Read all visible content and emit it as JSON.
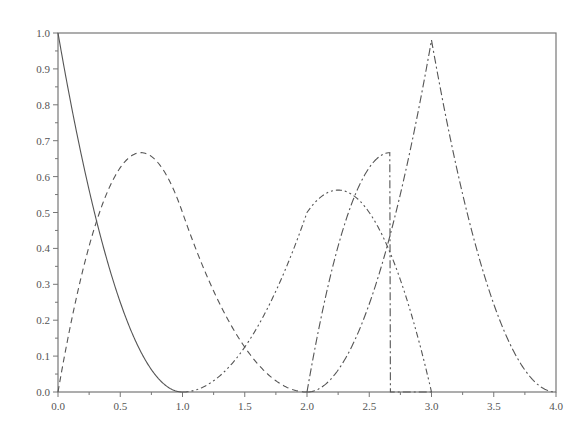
{
  "chart_data": {
    "type": "line",
    "title": "",
    "xlabel": "",
    "ylabel": "",
    "xlim": [
      0.0,
      4.0
    ],
    "ylim": [
      0.0,
      1.0
    ],
    "grid": false,
    "legend": null,
    "x_ticks": [
      "0.0",
      "0.5",
      "1.0",
      "1.5",
      "2.0",
      "2.5",
      "3.0",
      "3.5",
      "4.0"
    ],
    "y_ticks": [
      "0.0",
      "0.1",
      "0.2",
      "0.3",
      "0.4",
      "0.5",
      "0.6",
      "0.7",
      "0.8",
      "0.9",
      "1.0"
    ],
    "series": [
      {
        "name": "N0",
        "style": "solid",
        "support": [
          0,
          1
        ],
        "peak_x": 0.0,
        "peak_y": 1.0
      },
      {
        "name": "N1",
        "style": "dashed",
        "support": [
          0,
          2
        ],
        "peak_x": 0.67,
        "peak_y": 0.667
      },
      {
        "name": "N2",
        "style": "dash-dot-dot",
        "support": [
          1,
          3
        ],
        "peak_x": 1.5,
        "peak_y": 0.75
      },
      {
        "name": "N3",
        "style": "dash-dot",
        "support": [
          2,
          3
        ],
        "peak_x": 2.33,
        "peak_y": 0.667
      },
      {
        "name": "N4",
        "style": "dash-dot",
        "support": [
          2,
          4
        ],
        "peak_x": 3.0,
        "peak_y": 0.98
      }
    ]
  }
}
